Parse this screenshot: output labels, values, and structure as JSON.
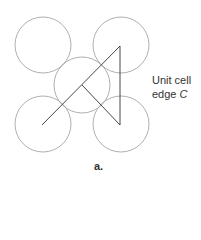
{
  "diagram": {
    "side_label_line1": "Unit cell",
    "side_label_line2_prefix": "edge ",
    "side_label_var": "C",
    "caption": "a.",
    "colors": {
      "circle": "#9a9a9a",
      "line": "#333333"
    },
    "circles": [
      {
        "cx": 43,
        "cy": 45,
        "r": 28
      },
      {
        "cx": 121,
        "cy": 45,
        "r": 28
      },
      {
        "cx": 82,
        "cy": 85,
        "r": 28
      },
      {
        "cx": 43,
        "cy": 124,
        "r": 28
      },
      {
        "cx": 121,
        "cy": 124,
        "r": 28
      }
    ]
  }
}
